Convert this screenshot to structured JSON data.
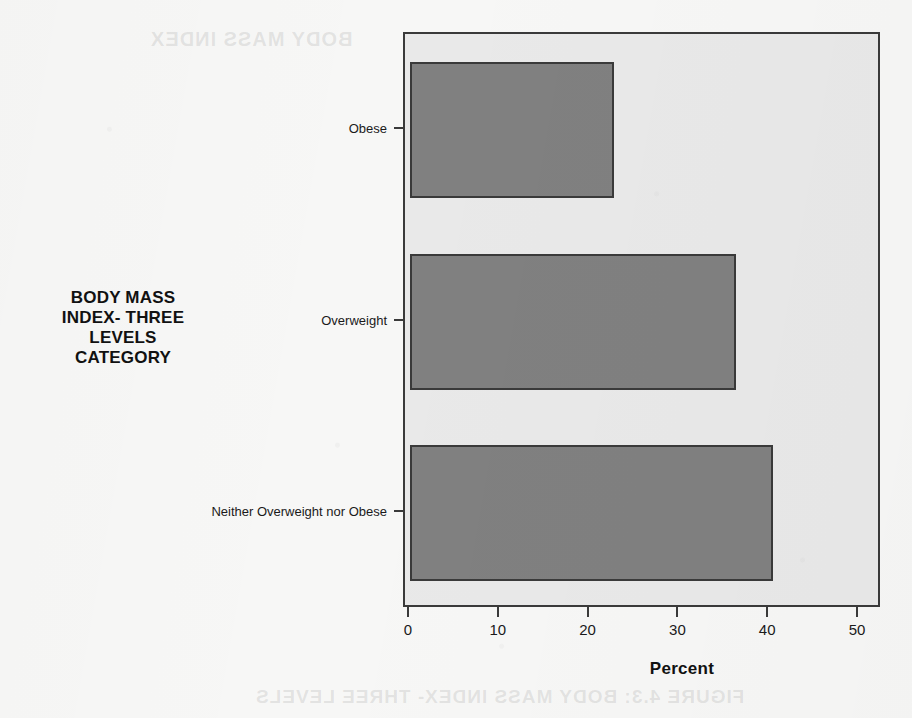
{
  "chart_data": {
    "type": "bar",
    "orientation": "horizontal",
    "title": "",
    "xlabel": "Percent",
    "ylabel": "BODY MASS INDEX- THREE LEVELS CATEGORY",
    "categories": [
      "Obese",
      "Overweight",
      "Neither Overweight nor Obese"
    ],
    "values": [
      22.7,
      36.3,
      40.4
    ],
    "xlim": [
      0,
      53.2
    ],
    "ylim": null,
    "xticks": [
      0,
      10,
      20,
      30,
      40,
      50
    ],
    "xticklabels": [
      "0",
      "10",
      "20",
      "30",
      "40",
      "50"
    ],
    "grid": false,
    "legend": false,
    "bar_color": "#808080",
    "bar_edge_color": "#3a3a3a",
    "plot_background": "#e9e9e9",
    "page_background": "#f7f7f6",
    "series": [
      {
        "name": "Percent",
        "values": [
          22.7,
          36.3,
          40.4
        ]
      }
    ]
  },
  "axes": {
    "y_title_lines": [
      "BODY MASS",
      "INDEX- THREE",
      "LEVELS",
      "CATEGORY"
    ],
    "x_title": "Percent"
  },
  "artifacts": {
    "bleed_top": "BODY MASS INDEX",
    "bleed_bottom": "FIGURE 4.3: BODY MASS INDEX- THREE LEVELS"
  }
}
